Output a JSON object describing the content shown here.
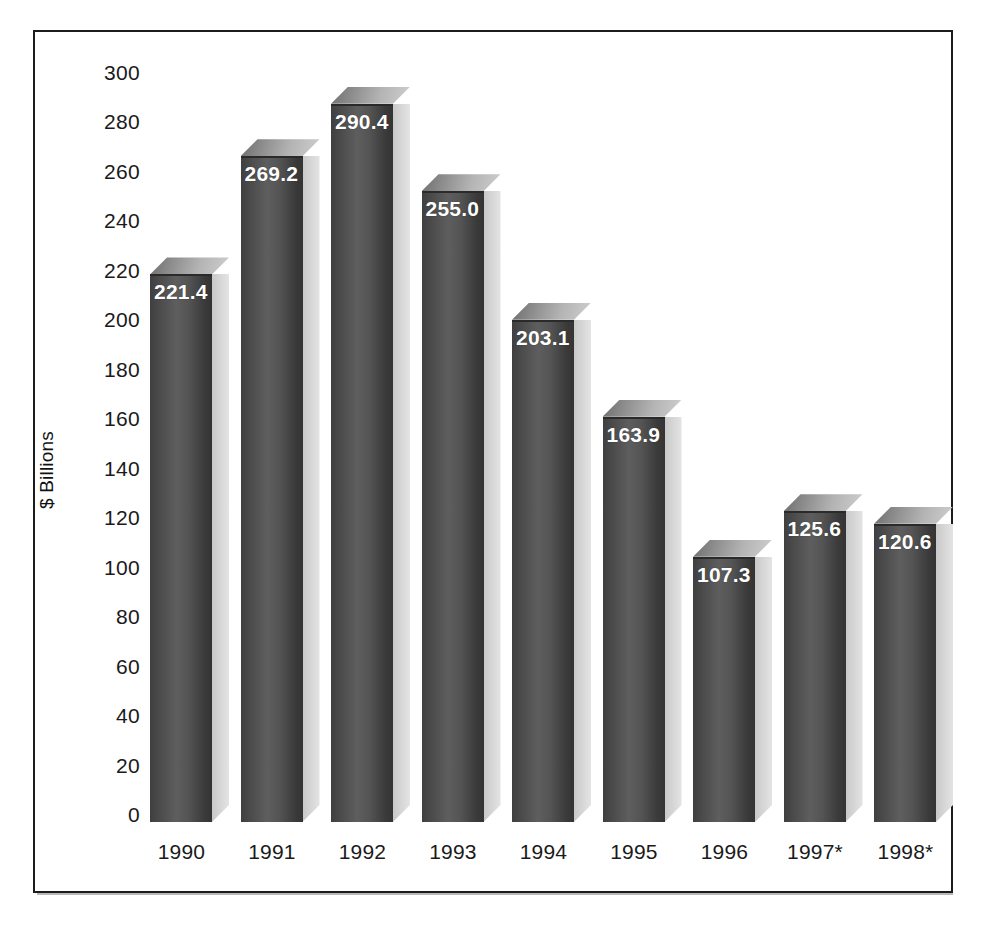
{
  "chart_data": {
    "type": "bar",
    "title": "",
    "subtitle": "",
    "xlabel": "",
    "ylabel": "$ Billions",
    "ylim": [
      0,
      300
    ],
    "ytick_step": 20,
    "grid": false,
    "legend": null,
    "style": "3d-column",
    "categories": [
      "1990",
      "1991",
      "1992",
      "1993",
      "1994",
      "1995",
      "1996",
      "1997*",
      "1998*"
    ],
    "values": [
      221.4,
      269.2,
      290.4,
      255.0,
      203.1,
      163.9,
      107.3,
      125.6,
      120.6
    ],
    "data_labels": [
      "221.4",
      "269.2",
      "290.4",
      "255.0",
      "203.1",
      "163.9",
      "107.3",
      "125.6",
      "120.6"
    ],
    "ytick_labels": [
      "300",
      "280",
      "260",
      "240",
      "220",
      "200",
      "180",
      "160",
      "140",
      "120",
      "100",
      "80",
      "60",
      "40",
      "20",
      "0"
    ],
    "ytick_values": [
      300,
      280,
      260,
      240,
      220,
      200,
      180,
      160,
      140,
      120,
      100,
      80,
      60,
      40,
      20,
      0
    ],
    "annotations": [
      "* denotes estimated or projected value"
    ],
    "colors": {
      "bar_front": "#4f4f4f",
      "bar_top": "#a8a8a8",
      "bar_side": "#d6d6d6",
      "label_text": "#ffffff",
      "axis_text": "#1a1a1a",
      "frame": "#1c1c1c",
      "background": "#ffffff"
    }
  },
  "axis": {
    "y_title": "$ Billions"
  }
}
